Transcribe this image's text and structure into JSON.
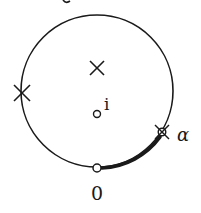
{
  "diagram": {
    "type": "complex-plane-contour",
    "colors": {
      "stroke": "#1a1a1a",
      "background": "#ffffff"
    },
    "circle": {
      "cx": 97,
      "cy": 91,
      "r": 76
    },
    "markers": [
      {
        "kind": "cross",
        "x": 97,
        "y": 68,
        "label": ""
      },
      {
        "kind": "cross",
        "x": 22,
        "y": 93,
        "label": ""
      },
      {
        "kind": "open-circle",
        "x": 97,
        "y": 114,
        "label": "i"
      },
      {
        "kind": "crossed-circle",
        "x": 162,
        "y": 132,
        "label": "α"
      },
      {
        "kind": "open-circle",
        "x": 97,
        "y": 167,
        "label": "0"
      }
    ],
    "thick_arc": {
      "from": "0",
      "to": "α"
    },
    "labels": {
      "i": "i",
      "alpha": "α",
      "zero": "0"
    }
  }
}
